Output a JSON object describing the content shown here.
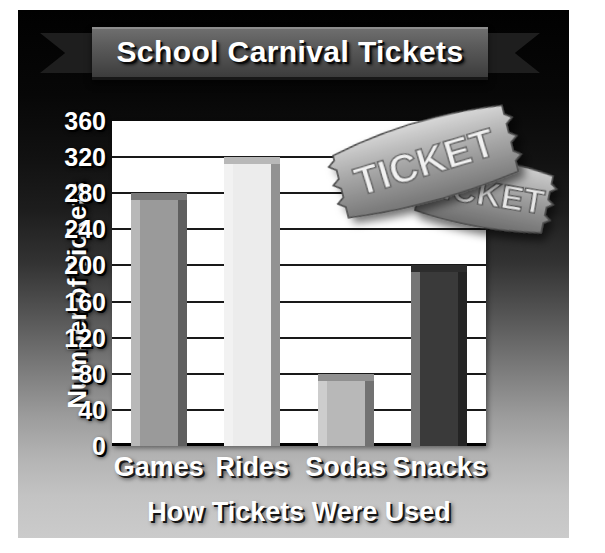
{
  "poster": {
    "title": "School Carnival Tickets",
    "decoration": {
      "ticket_front_text": "TICKET",
      "ticket_back_text": "TICKET"
    }
  },
  "chart_data": {
    "type": "bar",
    "title": "School Carnival Tickets",
    "categories": [
      "Games",
      "Rides",
      "Sodas",
      "Snacks"
    ],
    "values": [
      280,
      320,
      80,
      200
    ],
    "xlabel": "How Tickets Were Used",
    "ylabel": "Number of Tickets",
    "ylim": [
      0,
      360
    ],
    "ytick_step": 40,
    "yticks": [
      "360",
      "320",
      "280",
      "240",
      "200",
      "160",
      "120",
      "80",
      "40",
      "0"
    ],
    "grid": true,
    "legend": false,
    "series": [
      {
        "name": "Number of Tickets",
        "values": [
          280,
          320,
          80,
          200
        ]
      }
    ],
    "bar_colors": [
      "#9a9a9a",
      "#ececec",
      "#b8b8b8",
      "#3a3a3a"
    ]
  },
  "colors": {
    "plate_top": "#010101",
    "plate_bottom": "#cbcbcb",
    "plot_background": "#ffffff",
    "gridline": "#191919",
    "text": "#ffffff",
    "ribbon": "#5b5b5b"
  }
}
